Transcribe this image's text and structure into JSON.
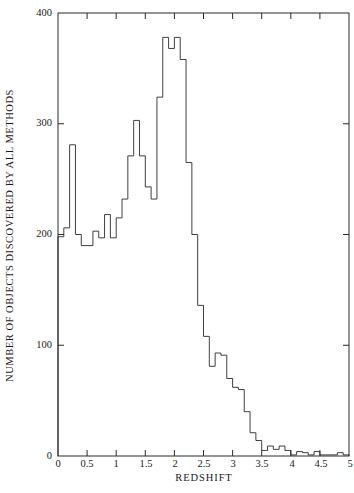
{
  "chart_data": {
    "type": "bar",
    "subtype": "histogram-step",
    "title": "",
    "subtitle": "",
    "xlabel": "REDSHIFT",
    "ylabel": "NUMBER OF OBJECTS DISCOVERED BY ALL METHODS",
    "xlim": [
      0,
      5
    ],
    "ylim": [
      0,
      400
    ],
    "bin_width": 0.1,
    "grid": false,
    "legend": null,
    "xticks": [
      0,
      0.5,
      1,
      1.5,
      2,
      2.5,
      3,
      3.5,
      4,
      4.5,
      5
    ],
    "xtick_labels": [
      "0",
      "0.5",
      "1",
      "1.5",
      "2",
      "2.5",
      "3",
      "3.5",
      "4",
      "4.5",
      "5"
    ],
    "yticks": [
      0,
      100,
      200,
      300,
      400
    ],
    "ytick_labels": [
      "0",
      "100",
      "200",
      "300",
      "400"
    ],
    "bin_edges": [
      0,
      0.1,
      0.2,
      0.3,
      0.4,
      0.5,
      0.6,
      0.7,
      0.8,
      0.9,
      1.0,
      1.1,
      1.2,
      1.3,
      1.4,
      1.5,
      1.6,
      1.7,
      1.8,
      1.9,
      2.0,
      2.1,
      2.2,
      2.3,
      2.4,
      2.5,
      2.6,
      2.7,
      2.8,
      2.9,
      3.0,
      3.1,
      3.2,
      3.3,
      3.4,
      3.5,
      3.6,
      3.7,
      3.8,
      3.9,
      4.0,
      4.1,
      4.2,
      4.3,
      4.4,
      4.5,
      4.6,
      4.7,
      4.8,
      4.9,
      5.0
    ],
    "categories": [
      "0.05",
      "0.15",
      "0.25",
      "0.35",
      "0.45",
      "0.55",
      "0.65",
      "0.75",
      "0.85",
      "0.95",
      "1.05",
      "1.15",
      "1.25",
      "1.35",
      "1.45",
      "1.55",
      "1.65",
      "1.75",
      "1.85",
      "1.95",
      "2.05",
      "2.15",
      "2.25",
      "2.35",
      "2.45",
      "2.55",
      "2.65",
      "2.75",
      "2.85",
      "2.95",
      "3.05",
      "3.15",
      "3.25",
      "3.35",
      "3.45",
      "3.55",
      "3.65",
      "3.75",
      "3.85",
      "3.95",
      "4.05",
      "4.15",
      "4.25",
      "4.35",
      "4.45",
      "4.55",
      "4.65",
      "4.75",
      "4.85",
      "4.95"
    ],
    "values": [
      198,
      206,
      281,
      200,
      190,
      190,
      203,
      197,
      218,
      197,
      215,
      232,
      271,
      303,
      271,
      243,
      232,
      324,
      378,
      368,
      378,
      358,
      265,
      200,
      136,
      108,
      81,
      93,
      91,
      70,
      62,
      60,
      40,
      21,
      14,
      5,
      9,
      6,
      9,
      5,
      1,
      4,
      3,
      1,
      4,
      1,
      1,
      1,
      3,
      1
    ],
    "peak": {
      "value": 378,
      "at_redshift": 1.9,
      "secondary_at_redshift": 2.1
    }
  },
  "axes": {
    "line_color": "#2a2a2a",
    "line_width": 1,
    "tick_direction": "in"
  }
}
